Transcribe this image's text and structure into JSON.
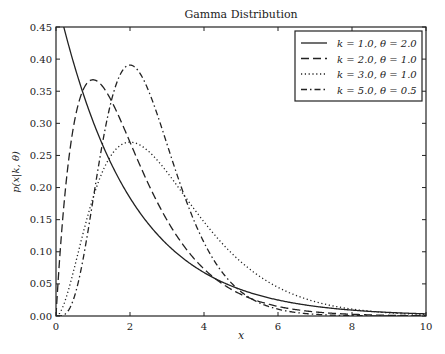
{
  "chart_data": {
    "type": "line",
    "title": "Gamma Distribution",
    "xlabel": "x",
    "ylabel": "p(x|k, θ)",
    "xlim": [
      0,
      10
    ],
    "ylim": [
      0,
      0.45
    ],
    "xticks": [
      "0",
      "2",
      "4",
      "6",
      "8",
      "10"
    ],
    "yticks": [
      "0.00",
      "0.05",
      "0.10",
      "0.15",
      "0.20",
      "0.25",
      "0.30",
      "0.35",
      "0.40",
      "0.45"
    ],
    "grid": false,
    "legend_position": "upper right",
    "x": [
      0,
      1,
      2,
      3,
      4,
      5,
      6,
      7,
      8,
      9,
      10
    ],
    "series": [
      {
        "name": "k = 1.0, θ = 2.0",
        "k": 1.0,
        "theta": 2.0,
        "style": "solid",
        "values": [
          0.5,
          0.303,
          0.184,
          0.112,
          0.068,
          0.041,
          0.025,
          0.015,
          0.009,
          0.006,
          0.003
        ]
      },
      {
        "name": "k = 2.0, θ = 1.0",
        "k": 2.0,
        "theta": 1.0,
        "style": "dashed",
        "values": [
          0.0,
          0.368,
          0.271,
          0.149,
          0.073,
          0.034,
          0.015,
          0.006,
          0.003,
          0.001,
          0.0005
        ]
      },
      {
        "name": "k = 3.0, θ = 1.0",
        "k": 3.0,
        "theta": 1.0,
        "style": "dotted",
        "values": [
          0.0,
          0.184,
          0.271,
          0.224,
          0.147,
          0.084,
          0.045,
          0.022,
          0.011,
          0.005,
          0.002
        ]
      },
      {
        "name": "k = 5.0, θ = 0.5",
        "k": 5.0,
        "theta": 0.5,
        "style": "dashdot",
        "values": [
          0.0,
          0.18,
          0.391,
          0.268,
          0.114,
          0.038,
          0.011,
          0.003,
          0.0007,
          0.0002,
          4e-05
        ]
      }
    ]
  },
  "colors": {
    "line": "#222222",
    "axes": "#222222",
    "background": "#ffffff"
  }
}
